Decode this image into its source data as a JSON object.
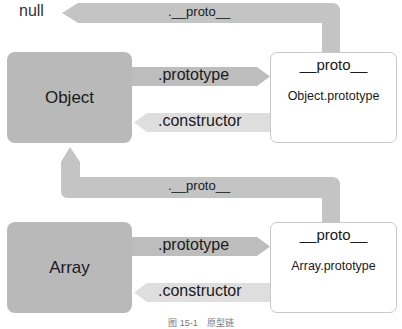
{
  "diagram": {
    "null_label": "null",
    "top_link": {
      "label": ".__proto__"
    },
    "middle_link": {
      "label": ".__proto__"
    },
    "object_row": {
      "constructor_box": {
        "label": "Object"
      },
      "prototype_arrow": {
        "label": ".prototype"
      },
      "constructor_arrow": {
        "label": ".constructor"
      },
      "prototype_box": {
        "header": "__proto__",
        "name": "Object.prototype"
      }
    },
    "array_row": {
      "constructor_box": {
        "label": "Array"
      },
      "prototype_arrow": {
        "label": ".prototype"
      },
      "constructor_arrow": {
        "label": ".constructor"
      },
      "prototype_box": {
        "header": "__proto__",
        "name": "Array.prototype"
      }
    },
    "caption": "图 15-1　原型链",
    "colors": {
      "constructor_box": "#b9b9b9",
      "prototype_arrow": "#bdbdbd",
      "constructor_arrow": "#dedede",
      "proto_link": "#c4c4c4",
      "prototype_box_border": "#c8c8c8"
    }
  }
}
